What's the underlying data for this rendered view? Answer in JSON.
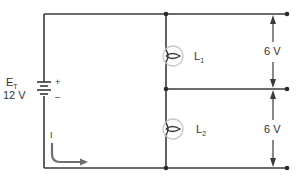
{
  "diagram": {
    "type": "series circuit schematic",
    "source": {
      "label": "E",
      "label_subscript": "T",
      "value": "12 V",
      "plus": "+",
      "minus": "–"
    },
    "current": {
      "label": "I"
    },
    "lamps": [
      {
        "label": "L",
        "subscript": "1",
        "voltage": "6 V"
      },
      {
        "label": "L",
        "subscript": "2",
        "voltage": "6 V"
      }
    ],
    "colors": {
      "wire": "#3a3a3a",
      "lamp_ring": "#c8c8c8",
      "current_arrow": "#6e6e6e",
      "text": "#333333"
    }
  }
}
